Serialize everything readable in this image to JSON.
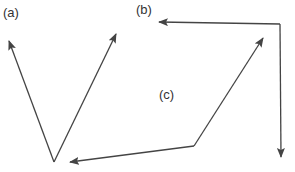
{
  "diagram": {
    "type": "vector-diagrams",
    "line_color": "#444444",
    "panels": [
      {
        "label": "(a)",
        "label_pos": [
          3,
          6
        ],
        "description": "Two vectors from a common origin forming a V",
        "vectors": [
          {
            "from": [
              54,
              162
            ],
            "to": [
              9,
              41
            ]
          },
          {
            "from": [
              54,
              162
            ],
            "to": [
              116,
              34
            ]
          }
        ]
      },
      {
        "label": "(b)",
        "label_pos": [
          136,
          3
        ],
        "description": "Two perpendicular vectors from a common origin at the top-right corner",
        "vectors": [
          {
            "from": [
              280,
              24
            ],
            "to": [
              159,
              22
            ]
          },
          {
            "from": [
              280,
              24
            ],
            "to": [
              281,
              157
            ]
          }
        ]
      },
      {
        "label": "(c)",
        "label_pos": [
          159,
          88
        ],
        "description": "Bent path with arrowheads at both ends",
        "vectors": [
          {
            "from": [
              194,
              146
            ],
            "to": [
              263,
              38
            ]
          },
          {
            "from": [
              194,
              146
            ],
            "to": [
              70,
              162
            ]
          }
        ]
      }
    ]
  }
}
